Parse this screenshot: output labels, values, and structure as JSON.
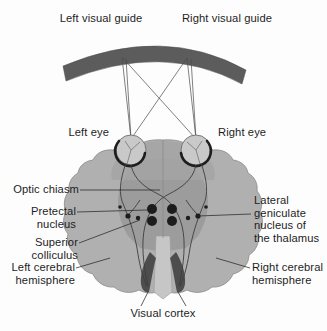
{
  "figure": {
    "title_top_left": "Left visual guide",
    "title_top_right": "Right visual guide",
    "eye_left": "Left eye",
    "eye_right": "Right eye",
    "labels_left": [
      "Optic chiasm",
      "Pretectal\nnucleus",
      "Superior\ncolliculus",
      "Left cerebral\nhemisphere"
    ],
    "labels_right": [
      "Lateral\ngeniculate\nnucleus of\nthe thalamus",
      "Right cerebral\nhemisphere"
    ],
    "label_bottom": "Visual cortex",
    "colors": {
      "visual_guide_bar": "#5c5c5c",
      "brain_fill": "#b0b0b0",
      "brain_inner": "#9a9a9a",
      "brain_stem": "#c4c4c4",
      "nucleus_dark": "#1c1c1c",
      "visual_cortex": "#4a4a4a",
      "nerve_line": "#3a3a3a",
      "ray_line": "#4a4a4a",
      "leader_line": "#2a2a2a",
      "text": "#1d1d1d",
      "background": "#fdfdfd"
    }
  }
}
